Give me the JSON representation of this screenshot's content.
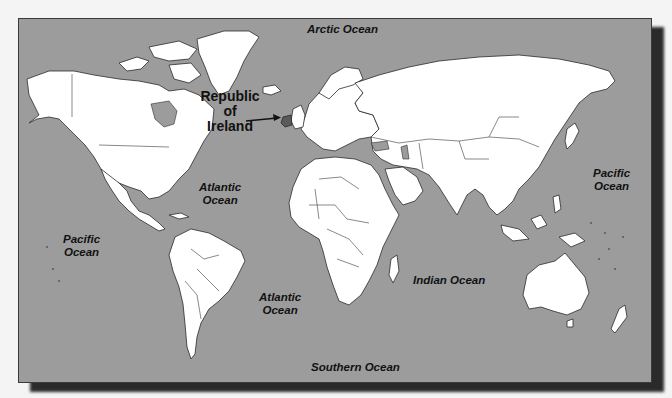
{
  "map": {
    "title": "World Map",
    "colors": {
      "ocean": "#9c9c9c",
      "land": "#ffffff",
      "outline": "#2b2b2b",
      "shadow": "#2a2a2a",
      "background": "#f4f4f4"
    },
    "callout": {
      "line1": "Republic",
      "line2": "of",
      "line3": "Ireland",
      "target": "Ireland",
      "arrow-icon": "arrow-right"
    },
    "oceans": [
      {
        "id": "arctic",
        "line1": "Arctic Ocean",
        "line2": ""
      },
      {
        "id": "atlantic-north",
        "line1": "Atlantic",
        "line2": "Ocean"
      },
      {
        "id": "atlantic-south",
        "line1": "Atlantic",
        "line2": "Ocean"
      },
      {
        "id": "pacific-west",
        "line1": "Pacific",
        "line2": "Ocean"
      },
      {
        "id": "pacific-east",
        "line1": "Pacific",
        "line2": "Ocean"
      },
      {
        "id": "indian",
        "line1": "Indian Ocean",
        "line2": ""
      },
      {
        "id": "southern",
        "line1": "Southern Ocean",
        "line2": ""
      }
    ]
  }
}
